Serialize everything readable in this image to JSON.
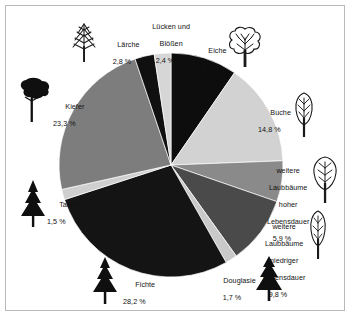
{
  "chart_data": {
    "type": "pie",
    "title": "",
    "subtitle": "",
    "xlabel": "",
    "ylabel": "",
    "legend_position": "callout-labels",
    "grid": false,
    "units": "%",
    "decimal_separator": ",",
    "total": 100.0,
    "start_angle_deg": 0,
    "direction": "clockwise",
    "categories": [
      "Eiche",
      "Buche",
      "weitere Laubbäume hoher Lebensdauer",
      "weitere Laubbäume niedriger Lebensdauer",
      "Douglasie",
      "Fichte",
      "Tanne",
      "Kiefer",
      "Lärche",
      "Lücken und Blößen"
    ],
    "values": [
      9.6,
      14.8,
      5.9,
      9.8,
      1.7,
      28.2,
      1.5,
      23.3,
      2.8,
      2.4
    ],
    "value_labels": [
      "9,6 %",
      "14,8 %",
      "5,9 %",
      "9,8 %",
      "1,7 %",
      "28,2 %",
      "1,5 %",
      "23,3 %",
      "2,8 %",
      "2,4 %"
    ],
    "colors": [
      "#0d0d0d",
      "#d2d2d2",
      "#8a8a8a",
      "#4a4a4a",
      "#c9c9c9",
      "#141414",
      "#cfcfcf",
      "#7d7d7d",
      "#101010",
      "#d6d6d6"
    ],
    "slices": [
      {
        "name": "Eiche",
        "label": "Eiche",
        "value": 9.6,
        "value_label": "9,6 %",
        "color": "#0d0d0d",
        "icon": "deciduous-tree-outline-icon"
      },
      {
        "name": "Buche",
        "label": "Buche",
        "value": 14.8,
        "value_label": "14,8 %",
        "color": "#d2d2d2",
        "icon": "beech-tree-outline-icon"
      },
      {
        "name": "weitere Laubbäume hoher Lebensdauer",
        "label": "weitere\nLaubbäume\nhoher\nLebensdauer",
        "value": 5.9,
        "value_label": "5,9 %",
        "color": "#8a8a8a",
        "icon": "broadleaf-tree-outline-icon"
      },
      {
        "name": "weitere Laubbäume niedriger Lebensdauer",
        "label": "weitere\nLaubbäume\nniedriger\nLebensdauer",
        "value": 9.8,
        "value_label": "9,8 %",
        "color": "#4a4a4a",
        "icon": "poplar-tree-outline-icon"
      },
      {
        "name": "Douglasie",
        "label": "Douglasie",
        "value": 1.7,
        "value_label": "1,7 %",
        "color": "#c9c9c9",
        "icon": "conifer-tree-solid-icon"
      },
      {
        "name": "Fichte",
        "label": "Fichte",
        "value": 28.2,
        "value_label": "28,2 %",
        "color": "#141414",
        "icon": "spruce-tree-solid-icon"
      },
      {
        "name": "Tanne",
        "label": "Tanne",
        "value": 1.5,
        "value_label": "1,5 %",
        "color": "#cfcfcf",
        "icon": "fir-tree-solid-icon"
      },
      {
        "name": "Kiefer",
        "label": "Kiefer",
        "value": 23.3,
        "value_label": "23,3 %",
        "color": "#7d7d7d",
        "icon": "pine-tree-solid-icon"
      },
      {
        "name": "Lärche",
        "label": "Lärche",
        "value": 2.8,
        "value_label": "2,8 %",
        "color": "#101010",
        "icon": "larch-tree-outline-icon"
      },
      {
        "name": "Lücken und Blößen",
        "label": "Lücken und\nBlößen",
        "value": 2.4,
        "value_label": "2,4 %",
        "color": "#d6d6d6",
        "icon": "none"
      }
    ]
  },
  "labels": {
    "eiche": {
      "name": "Eiche",
      "value": "9,6 %"
    },
    "buche": {
      "name": "Buche",
      "value": "14,8 %"
    },
    "laub_hoch_l1": "weitere",
    "laub_hoch_l2": "Laubbäume",
    "laub_hoch_l3": "hoher",
    "laub_hoch_l4": "Lebensdauer",
    "laub_hoch_val": "5,9 %",
    "laub_nied_l1": "weitere",
    "laub_nied_l2": "Laubbäume",
    "laub_nied_l3": "niedriger",
    "laub_nied_l4": "Lebensdauer",
    "laub_nied_val": "9,8 %",
    "douglasie": {
      "name": "Douglasie",
      "value": "1,7 %"
    },
    "fichte": {
      "name": "Fichte",
      "value": "28,2 %"
    },
    "tanne": {
      "name": "Tanne",
      "value": "1,5 %"
    },
    "kiefer": {
      "name": "Kiefer",
      "value": "23,3 %"
    },
    "laerche": {
      "name": "Lärche",
      "value": "2,8 %"
    },
    "luecken_l1": "Lücken und",
    "luecken_l2": "Blößen",
    "luecken_val": "2,4 %"
  },
  "style": {
    "frame_color": "#b9b9b9",
    "background": "#ffffff",
    "text_color": "#111111"
  }
}
